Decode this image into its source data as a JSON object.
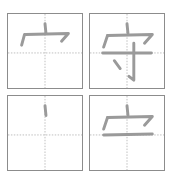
{
  "character": "守",
  "colors": {
    "border": "#8c8c8c",
    "guide": "#bdbdbd",
    "stroke": "#9a9a9a"
  },
  "cells": [
    {
      "step": 1,
      "label": "宀 (partial)",
      "position": "top-left"
    },
    {
      "step": 2,
      "label": "守",
      "position": "top-right"
    },
    {
      "step": 3,
      "label": "dot stroke",
      "position": "bottom-left"
    },
    {
      "step": 4,
      "label": "宀 + horizontal",
      "position": "bottom-right"
    }
  ]
}
